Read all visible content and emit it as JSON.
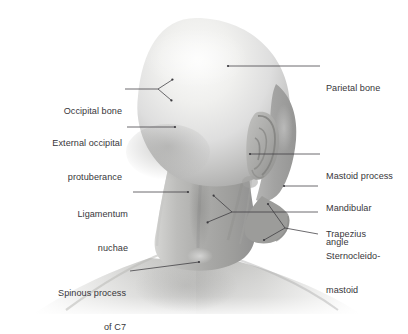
{
  "figure": {
    "background_color": "#ffffff",
    "label_text_color": "#37363a",
    "leader_line_color": "#3b3a3e",
    "skin_highlight_color": "#f3f3f1",
    "skin_midtone_color": "#c9c9c7",
    "skin_shadow_color": "#8e8e8e"
  },
  "labels": {
    "occipital_bone": {
      "text": "Occipital bone",
      "align": "right",
      "lines": [
        "Occipital bone"
      ]
    },
    "external_occipital_protuberance": {
      "text": "External occipital\nprotuberance",
      "align": "right",
      "line1": "External occipital",
      "line2": "protuberance"
    },
    "ligamentum_nuchae": {
      "text": "Ligamentum\nnuchae",
      "align": "right",
      "line1": "Ligamentum",
      "line2": "nuchae"
    },
    "spinous_process_c7": {
      "text": "Spinous process\nof C7",
      "align": "right",
      "line1": "Spinous process",
      "line2": "of C7"
    },
    "parietal_bone": {
      "text": "Parietal bone",
      "align": "left",
      "lines": [
        "Parietal bone"
      ]
    },
    "mastoid_process": {
      "text": "Mastoid process",
      "align": "left",
      "lines": [
        "Mastoid process"
      ]
    },
    "mandibular_angle": {
      "text": "Mandibular\nangle",
      "align": "left",
      "line1": "Mandibular",
      "line2": "angle"
    },
    "trapezius": {
      "text": "Trapezius",
      "align": "left",
      "lines": [
        "Trapezius"
      ]
    },
    "sternocleidomastoid": {
      "text": "Sternocleido-\nmastoid",
      "align": "left",
      "line1": "Sternocleido-",
      "line2": "mastoid"
    }
  }
}
